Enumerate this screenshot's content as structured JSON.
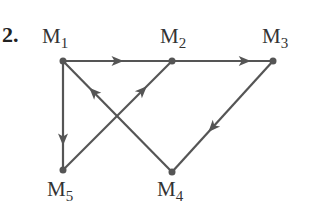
{
  "problem_number": "2.",
  "colors": {
    "ink": "#555555",
    "text": "#333333",
    "background": "#ffffff"
  },
  "nodes": [
    {
      "id": "M1",
      "label": "M",
      "sub": "1",
      "x": 63,
      "y": 61,
      "lx": 42,
      "ly": 43
    },
    {
      "id": "M2",
      "label": "M",
      "sub": "2",
      "x": 172,
      "y": 61,
      "lx": 160,
      "ly": 43
    },
    {
      "id": "M3",
      "label": "M",
      "sub": "3",
      "x": 273,
      "y": 61,
      "lx": 262,
      "ly": 43
    },
    {
      "id": "M4",
      "label": "M",
      "sub": "4",
      "x": 172,
      "y": 172,
      "lx": 157,
      "ly": 196
    },
    {
      "id": "M5",
      "label": "M",
      "sub": "5",
      "x": 63,
      "y": 170,
      "lx": 47,
      "ly": 196
    }
  ],
  "edges": [
    {
      "from": "M1",
      "to": "M2",
      "arrow_t": 0.5
    },
    {
      "from": "M2",
      "to": "M3",
      "arrow_t": 0.72
    },
    {
      "from": "M1",
      "to": "M5",
      "arrow_t": 0.72
    },
    {
      "from": "M5",
      "to": "M2",
      "arrow_t": 0.73
    },
    {
      "from": "M4",
      "to": "M1",
      "arrow_t": 0.72
    },
    {
      "from": "M3",
      "to": "M4",
      "arrow_t": 0.6
    }
  ]
}
